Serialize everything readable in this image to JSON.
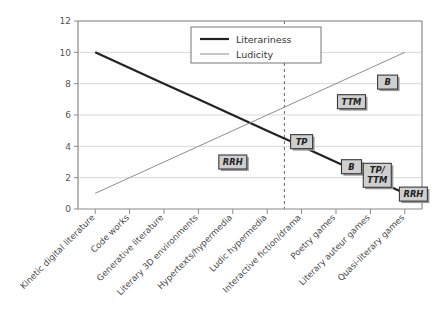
{
  "chart_data": {
    "type": "line",
    "title": "",
    "xlabel": "",
    "ylabel": "",
    "ylim": [
      0,
      12
    ],
    "yticks": [
      0,
      2,
      4,
      6,
      8,
      10,
      12
    ],
    "grid": true,
    "legend_position": "top-center",
    "categories": [
      "Kinetic digital literature",
      "Code works",
      "Generative literature",
      "Literary 3D environments",
      "Hypertexts/hypermedia",
      "Ludic hypermedia",
      "Interactive fiction/drama",
      "Poetry games",
      "Literary auteur games",
      "Quasi-literary games"
    ],
    "series": [
      {
        "name": "Literariness",
        "color": "#222222",
        "width": 2.2,
        "values": [
          10,
          9,
          8,
          7,
          6,
          5,
          4,
          3,
          2,
          1
        ]
      },
      {
        "name": "Ludicity",
        "color": "#8d8d8d",
        "width": 1.0,
        "values": [
          1,
          2,
          3,
          4,
          5,
          6,
          7,
          8,
          9,
          10
        ]
      }
    ],
    "divider": {
      "name": "literary-ludic-divider",
      "after_category_index": 5,
      "style": "dashed",
      "color": "#666666"
    },
    "annotations": [
      {
        "id": "rrh-ludicity",
        "label": "RRH",
        "lines": [
          "RRH"
        ],
        "x_index": 4,
        "y": 3.0
      },
      {
        "id": "tp-crossing",
        "label": "TP",
        "lines": [
          "TP"
        ],
        "x_index": 6,
        "y": 4.3
      },
      {
        "id": "ttm-ludicity",
        "label": "TTM",
        "lines": [
          "TTM"
        ],
        "x_index": 7.45,
        "y": 6.85
      },
      {
        "id": "b-ludicity",
        "label": "B",
        "lines": [
          "B"
        ],
        "x_index": 8.5,
        "y": 8.1
      },
      {
        "id": "b-literariness",
        "label": "B",
        "lines": [
          "B"
        ],
        "x_index": 7.45,
        "y": 2.7
      },
      {
        "id": "tp-ttm-literariness",
        "label": "TP/TTM",
        "lines": [
          "TP/",
          "TTM"
        ],
        "x_index": 8.2,
        "y": 2.15
      },
      {
        "id": "rrh-literariness",
        "label": "RRH",
        "lines": [
          "RRH"
        ],
        "x_index": 9.25,
        "y": 0.95
      }
    ]
  },
  "legend": {
    "items": [
      {
        "label": "Literariness",
        "color": "#222222",
        "width": 2.2
      },
      {
        "label": "Ludicity",
        "color": "#8d8d8d",
        "width": 1.0
      }
    ]
  },
  "colors": {
    "axis": "#8a8a8a",
    "grid": "#d8d8d8",
    "node_fill": "#cfcfcf",
    "node_stroke": "#3a3a3a",
    "node_shadow": "#9a9a9a",
    "text": "#4a4a4a",
    "background": "#ffffff"
  }
}
